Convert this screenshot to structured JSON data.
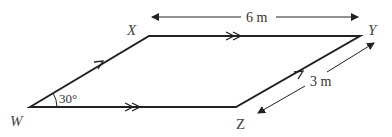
{
  "diagram": {
    "type": "parallelogram",
    "vertices": [
      {
        "name": "W",
        "label": "W"
      },
      {
        "name": "X",
        "label": "X"
      },
      {
        "name": "Y",
        "label": "Y"
      },
      {
        "name": "Z",
        "label": "Z"
      }
    ],
    "dimensions": {
      "top_length": "6 m",
      "side_length": "3 m"
    },
    "angle": {
      "vertex": "W",
      "label": "30°"
    },
    "parallel_marks": {
      "WX_ZY": "single arrow",
      "XY_WZ": "double arrow"
    },
    "colors": {
      "line": "#222222",
      "text": "#444444"
    }
  }
}
